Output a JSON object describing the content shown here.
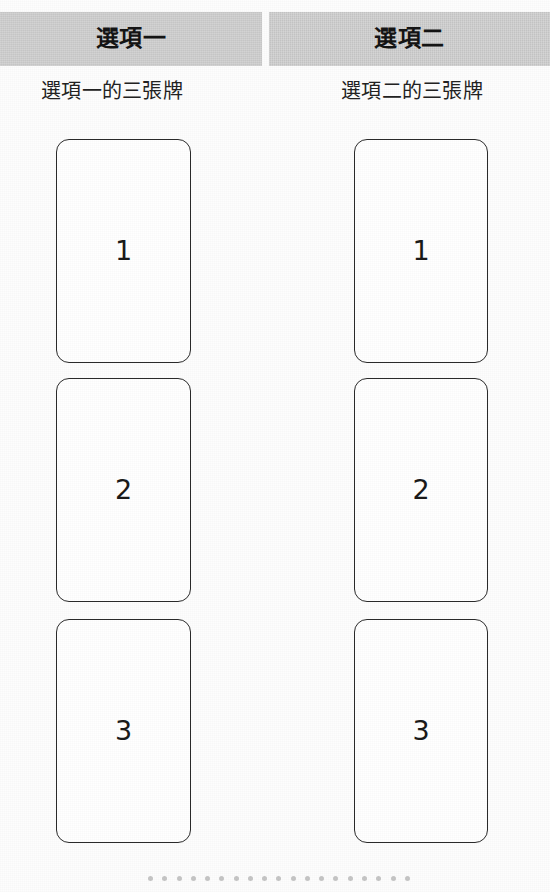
{
  "page": {
    "background_color": "#fdfdfd",
    "width": 550,
    "height": 892
  },
  "tabs": {
    "background_color": "#c9c9c9",
    "text_color": "#141414",
    "items": [
      {
        "label": "選項一"
      },
      {
        "label": "選項二"
      }
    ]
  },
  "columns": [
    {
      "subtitle": "選項一的三張牌",
      "cards": [
        {
          "number": "1"
        },
        {
          "number": "2"
        },
        {
          "number": "3"
        }
      ]
    },
    {
      "subtitle": "選項二的三張牌",
      "cards": [
        {
          "number": "1"
        },
        {
          "number": "2"
        },
        {
          "number": "3"
        }
      ]
    }
  ],
  "pagination": {
    "dot_count": 19,
    "dot_color": "#c6c6c6"
  }
}
